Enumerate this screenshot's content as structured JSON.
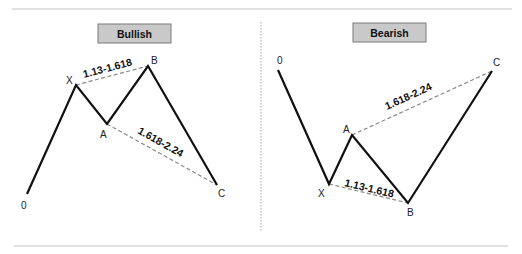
{
  "panels": {
    "bullish": {
      "title": "Bullish",
      "points": {
        "0": {
          "label": "0",
          "x": 27,
          "y": 194
        },
        "X": {
          "label": "X",
          "x": 76,
          "y": 85
        },
        "A": {
          "label": "A",
          "x": 107,
          "y": 124
        },
        "B": {
          "label": "B",
          "x": 148,
          "y": 66
        },
        "C": {
          "label": "C",
          "x": 217,
          "y": 185
        }
      },
      "ratios": {
        "xb": "1.13-1.618",
        "ac": "1.618-2.24"
      }
    },
    "bearish": {
      "title": "Bearish",
      "points": {
        "0": {
          "label": "0",
          "x": 278,
          "y": 70
        },
        "X": {
          "label": "X",
          "x": 329,
          "y": 184
        },
        "A": {
          "label": "A",
          "x": 352,
          "y": 135
        },
        "B": {
          "label": "B",
          "x": 408,
          "y": 203
        },
        "C": {
          "label": "C",
          "x": 492,
          "y": 71
        }
      },
      "ratios": {
        "xb": "1.13-1.618",
        "ac": "1.618-2.24"
      }
    }
  },
  "colors": {
    "title_box_fill": "#c9c9c9",
    "title_box_border": "#7a7a7a",
    "line": "#111111",
    "dashed": "#8a8a8a",
    "rule": "#d6d6d6",
    "divider": "#a8a8a8"
  }
}
